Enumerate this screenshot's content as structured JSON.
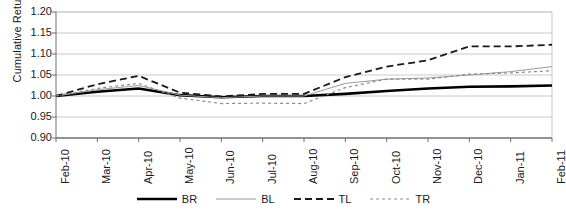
{
  "chart_data": {
    "type": "line",
    "title": "",
    "xlabel": "",
    "ylabel": "Cumulative Return",
    "ylim": [
      0.9,
      1.2
    ],
    "yticks": [
      "0.90",
      "0.95",
      "1.00",
      "1.05",
      "1.10",
      "1.15",
      "1.20"
    ],
    "grid": true,
    "legend_position": "bottom",
    "categories": [
      "Feb-10",
      "Mar-10",
      "Apr-10",
      "May-10",
      "Jun-10",
      "Jul-10",
      "Aug-10",
      "Sep-10",
      "Oct-10",
      "Nov-10",
      "Dec-10",
      "Jan-11",
      "Feb-11"
    ],
    "series": [
      {
        "name": "BR",
        "style": "solid-thick-black",
        "color": "#000000",
        "values": [
          1.0,
          1.01,
          1.018,
          1.002,
          0.997,
          1.0,
          1.0,
          1.005,
          1.012,
          1.018,
          1.022,
          1.023,
          1.025
        ]
      },
      {
        "name": "BL",
        "style": "solid-thin-gray",
        "color": "#9a9a9a",
        "values": [
          1.0,
          1.015,
          1.025,
          1.002,
          0.996,
          1.0,
          1.0,
          1.03,
          1.04,
          1.043,
          1.05,
          1.058,
          1.07
        ]
      },
      {
        "name": "TL",
        "style": "dashed-long-black",
        "color": "#1a1a1a",
        "values": [
          1.0,
          1.028,
          1.048,
          1.008,
          0.999,
          1.005,
          1.005,
          1.045,
          1.07,
          1.085,
          1.118,
          1.118,
          1.122
        ]
      },
      {
        "name": "TR",
        "style": "dashed-short-gray",
        "color": "#8a8a8a",
        "values": [
          1.0,
          1.018,
          1.03,
          0.995,
          0.982,
          0.983,
          0.982,
          1.02,
          1.04,
          1.04,
          1.052,
          1.055,
          1.06
        ]
      }
    ]
  },
  "legend": {
    "items": [
      {
        "label": "BR"
      },
      {
        "label": "BL"
      },
      {
        "label": "TL"
      },
      {
        "label": "TR"
      }
    ]
  }
}
